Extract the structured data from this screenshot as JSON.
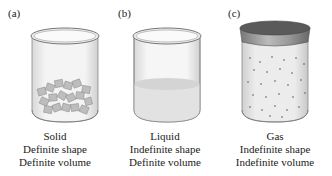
{
  "panels": [
    {
      "label": "(a)",
      "state": "Solid",
      "shape": "Definite shape",
      "volume": "Definite volume"
    },
    {
      "label": "(b)",
      "state": "Liquid",
      "shape": "Indefinite shape",
      "volume": "Definite volume"
    },
    {
      "label": "(c)",
      "state": "Gas",
      "shape": "Indefinite shape",
      "volume": "Indefinite volume"
    }
  ]
}
